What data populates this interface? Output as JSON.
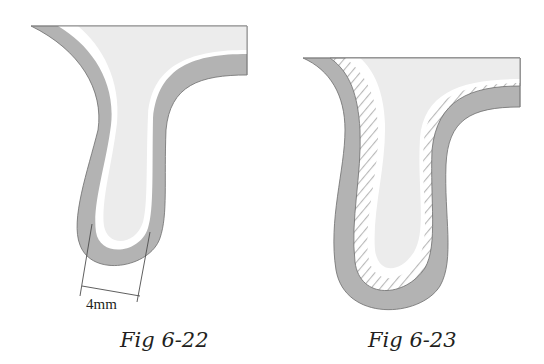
{
  "figures": [
    {
      "id": "fig-6-22",
      "caption": "Fig 6-22",
      "dimension_label": "4mm",
      "layers": [
        "tooth-core",
        "white-gap",
        "gray-coating"
      ]
    },
    {
      "id": "fig-6-23",
      "caption": "Fig 6-23",
      "layers": [
        "tooth-core",
        "white-gap",
        "hatched-layer",
        "gray-coating"
      ]
    }
  ],
  "colors": {
    "core_fill": "#ececec",
    "coating_fill": "#b3b3b3",
    "outline": "#6d6d6d",
    "hatch": "#b8b8b8",
    "text": "#231f20"
  }
}
